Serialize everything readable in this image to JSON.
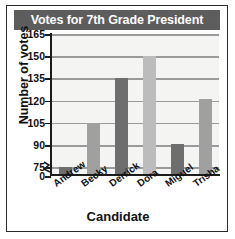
{
  "figure": {
    "frame_color": "#2b2b2b",
    "background": "#ffffff"
  },
  "title": {
    "text": "Votes for 7th Grade President",
    "banner_color": "#5d5d5d",
    "text_color": "#ffffff"
  },
  "chart_data": {
    "type": "bar",
    "title": "Votes for 7th Grade President",
    "xlabel": "Candidate",
    "ylabel": "Number of votes",
    "categories": [
      "Andrew",
      "Becky",
      "Derrick",
      "Dora",
      "Miguel",
      "Trisha"
    ],
    "values": [
      75,
      105,
      135,
      150,
      91,
      121
    ],
    "bar_colors": [
      "#6e6e6e",
      "#a0a0a0",
      "#6e6e6e",
      "#bcbcbc",
      "#6e6e6e",
      "#a0a0a0"
    ],
    "ylim": [
      0,
      165
    ],
    "yticks": [
      0,
      75,
      90,
      105,
      120,
      135,
      150,
      165
    ],
    "ytick_labels": [
      "0",
      "75",
      "90",
      "105",
      "120",
      "135",
      "150",
      "165"
    ],
    "axis_break": true,
    "axis_break_between": [
      0,
      75
    ],
    "gridlines": [
      75,
      90,
      105,
      120,
      135,
      150,
      165
    ],
    "grid": true,
    "legend": null,
    "plot_background": "#f4f4f2",
    "gridline_color": "#9a9a9a"
  },
  "axes": {
    "x_title": "Candidate",
    "y_title": "Number of votes",
    "axis_color": "#1c1c1c"
  }
}
